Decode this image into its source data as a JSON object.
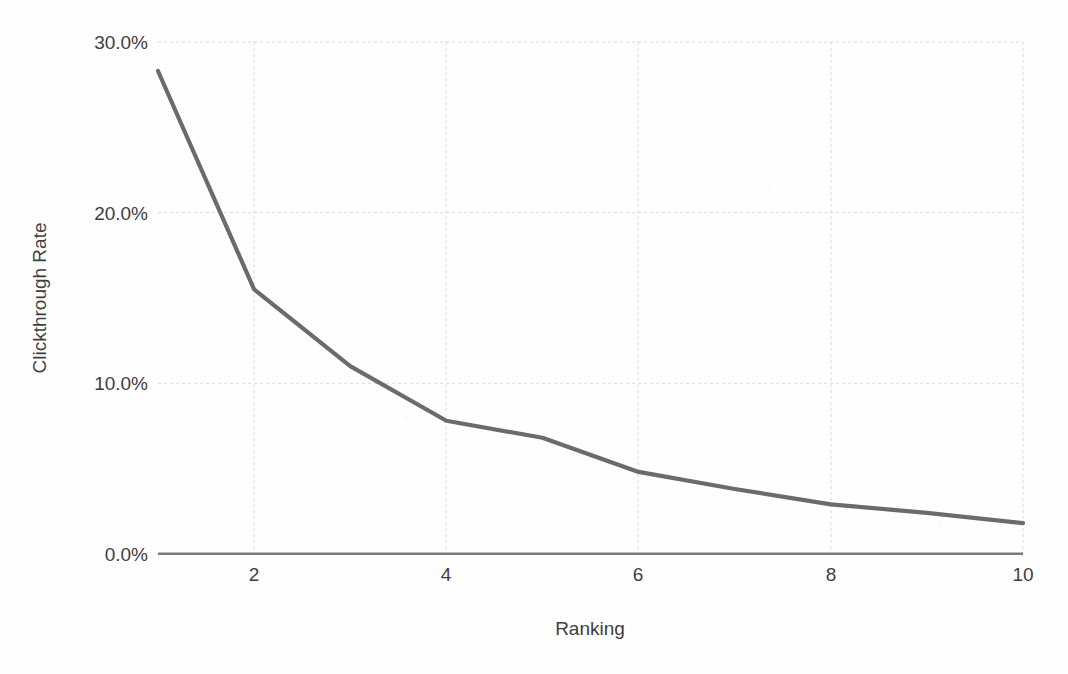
{
  "chart_data": {
    "type": "line",
    "title": "",
    "xlabel": "Ranking",
    "ylabel": "Clickthrough Rate",
    "x": [
      1,
      2,
      3,
      4,
      5,
      6,
      7,
      8,
      9,
      10
    ],
    "values": [
      28.3,
      15.5,
      11.0,
      7.8,
      6.8,
      4.8,
      3.8,
      2.9,
      2.4,
      1.8
    ],
    "series": [
      {
        "name": "Clickthrough Rate",
        "values": [
          28.3,
          15.5,
          11.0,
          7.8,
          6.8,
          4.8,
          3.8,
          2.9,
          2.4,
          1.8
        ]
      }
    ],
    "xlim": [
      1,
      10
    ],
    "ylim": [
      0,
      30
    ],
    "xticks": [
      2,
      4,
      6,
      8,
      10
    ],
    "yticks": [
      0,
      10,
      20,
      30
    ],
    "xtick_labels": [
      "2",
      "4",
      "6",
      "8",
      "10"
    ],
    "ytick_labels": [
      "0.0%",
      "10.0%",
      "20.0%",
      "30.0%"
    ],
    "grid": true,
    "legend": false,
    "legend_position": "none",
    "line_color": "#6b6b6b",
    "grid_color": "#d9d9d9",
    "axis_color": "#7a7a7a",
    "background_color": "#fefefe",
    "annotations": []
  },
  "axes": {
    "y_title": "Clickthrough Rate",
    "x_title": "Ranking",
    "y_tick_labels": [
      "30.0%",
      "20.0%",
      "10.0%",
      "0.0%"
    ],
    "x_tick_labels": [
      "2",
      "4",
      "6",
      "8",
      "10"
    ]
  }
}
